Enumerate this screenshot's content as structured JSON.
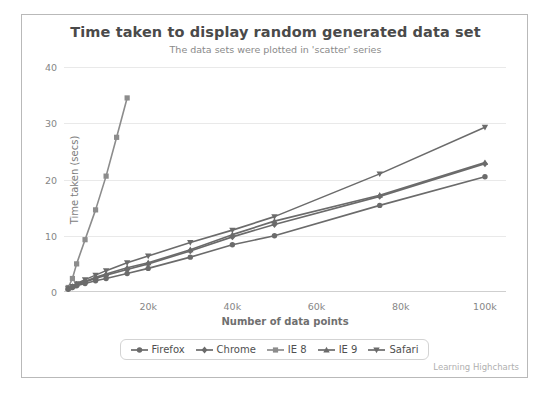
{
  "chart_data": {
    "type": "line",
    "title": "Time taken to display random generated data set",
    "subtitle": "The data sets were plotted in 'scatter' series",
    "xlabel": "Number of data points",
    "ylabel": "Time taken (secs)",
    "xlim": [
      0,
      105000
    ],
    "ylim": [
      0,
      40
    ],
    "xticks": [
      "20k",
      "40k",
      "60k",
      "80k",
      "100k"
    ],
    "xtick_values": [
      20000,
      40000,
      60000,
      80000,
      100000
    ],
    "yticks": [
      "0",
      "10",
      "20",
      "30",
      "40"
    ],
    "ytick_values": [
      0,
      10,
      20,
      30,
      40
    ],
    "grid": true,
    "legend_position": "bottom",
    "credits": "Learning Highcharts",
    "series": [
      {
        "name": "Firefox",
        "marker": "circle",
        "color": "#6b6b6b",
        "x": [
          1000,
          2000,
          3000,
          5000,
          7500,
          10000,
          15000,
          20000,
          30000,
          40000,
          50000,
          75000,
          100000
        ],
        "values": [
          0.5,
          0.8,
          1.1,
          1.5,
          2.0,
          2.4,
          3.3,
          4.2,
          6.2,
          8.4,
          10.0,
          15.4,
          20.5
        ]
      },
      {
        "name": "Chrome",
        "marker": "diamond",
        "color": "#6b6b6b",
        "x": [
          1000,
          2000,
          3000,
          5000,
          7500,
          10000,
          15000,
          20000,
          30000,
          40000,
          50000,
          75000,
          100000
        ],
        "values": [
          0.6,
          0.9,
          1.3,
          1.8,
          2.4,
          3.0,
          4.0,
          5.0,
          7.3,
          9.8,
          12.0,
          17.0,
          22.8
        ]
      },
      {
        "name": "IE 8",
        "marker": "square",
        "color": "#8c8c8c",
        "x": [
          1000,
          2000,
          3000,
          5000,
          7500,
          10000,
          12500,
          15000
        ],
        "values": [
          0.8,
          2.4,
          5.0,
          9.3,
          14.6,
          20.6,
          27.5,
          34.5
        ]
      },
      {
        "name": "IE 9",
        "marker": "triangle",
        "color": "#6b6b6b",
        "x": [
          1000,
          2000,
          3000,
          5000,
          7500,
          10000,
          15000,
          20000,
          30000,
          40000,
          50000,
          75000,
          100000
        ],
        "values": [
          0.7,
          1.0,
          1.4,
          1.9,
          2.6,
          3.2,
          4.3,
          5.2,
          7.5,
          10.2,
          12.6,
          17.2,
          23.0
        ]
      },
      {
        "name": "Safari",
        "marker": "triangle-down",
        "color": "#6b6b6b",
        "x": [
          1000,
          2000,
          3000,
          5000,
          7500,
          10000,
          15000,
          20000,
          30000,
          40000,
          50000,
          75000,
          100000
        ],
        "values": [
          0.6,
          1.0,
          1.5,
          2.2,
          3.0,
          3.8,
          5.2,
          6.4,
          8.8,
          11.0,
          13.4,
          21.0,
          29.3
        ]
      }
    ]
  }
}
